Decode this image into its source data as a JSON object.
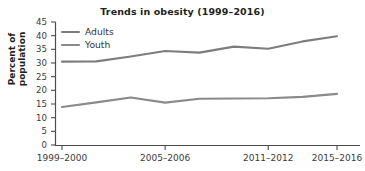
{
  "chart_data": {
    "type": "line",
    "title": "Trends in obesity (1999–2016)",
    "xlabel": "",
    "ylabel": "Percent of population",
    "ylim": [
      0,
      45
    ],
    "ytick_values": [
      0,
      5,
      10,
      15,
      20,
      25,
      30,
      35,
      40,
      45
    ],
    "ytick_labels": [
      "0",
      "5",
      "10",
      "15",
      "20",
      "25",
      "30",
      "35",
      "40",
      "45"
    ],
    "x": [
      "1999–2000",
      "2001–2002",
      "2003–2004",
      "2005–2006",
      "2007–2008",
      "2009–2010",
      "2011–2012",
      "2013–2014",
      "2015–2016"
    ],
    "xtick_labels": [
      "1999–2000",
      "2005–2006",
      "2011–2012",
      "2015–2016"
    ],
    "xtick_indices": [
      0,
      3,
      6,
      8
    ],
    "grid": false,
    "legend_position": "upper left",
    "series": [
      {
        "name": "Adults",
        "color": "#7d7d7d",
        "values": [
          30.5,
          30.6,
          32.4,
          34.4,
          33.8,
          36.0,
          35.2,
          37.9,
          39.8
        ]
      },
      {
        "name": "Youth",
        "color": "#8a8a8a",
        "values": [
          13.9,
          15.6,
          17.4,
          15.5,
          16.9,
          17.0,
          17.1,
          17.6,
          18.7
        ]
      }
    ]
  },
  "legend": {
    "items": [
      {
        "label": "Adults"
      },
      {
        "label": "Youth"
      }
    ]
  },
  "axis": {
    "y_title": "Percent of population"
  }
}
